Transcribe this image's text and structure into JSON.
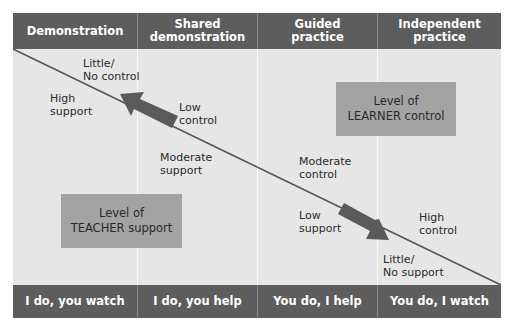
{
  "header": {
    "columns": [
      {
        "label": "Demonstration"
      },
      {
        "label": "Shared demonstration",
        "line1": "Shared",
        "line2": "demonstration"
      },
      {
        "label": "Guided practice",
        "line1": "Guided",
        "line2": "practice"
      },
      {
        "label": "Independent practice",
        "line1": "Independent",
        "line2": "practice"
      }
    ]
  },
  "footer": {
    "columns": [
      {
        "label": "I do, you watch"
      },
      {
        "label": "I do, you help"
      },
      {
        "label": "You do, I help"
      },
      {
        "label": "You do, I watch"
      }
    ]
  },
  "labels": {
    "little_no_control": {
      "line1": "Little/",
      "line2": "No control"
    },
    "high_support": {
      "line1": "High",
      "line2": "support"
    },
    "low_control": {
      "line1": "Low",
      "line2": "control"
    },
    "moderate_support": {
      "line1": "Moderate",
      "line2": "support"
    },
    "moderate_control": {
      "line1": "Moderate",
      "line2": "control"
    },
    "low_support": {
      "line1": "Low",
      "line2": "support"
    },
    "high_control": {
      "line1": "High",
      "line2": "control"
    },
    "little_no_support": {
      "line1": "Little/",
      "line2": "No support"
    }
  },
  "boxes": {
    "teacher": {
      "line1": "Level of",
      "line2": "TEACHER support"
    },
    "learner": {
      "line1": "Level of",
      "line2": "LEARNER control"
    }
  },
  "arrows": {
    "teacher_direction": "arrow-up-left",
    "learner_direction": "arrow-down-right"
  },
  "colors": {
    "bar": "#5d5d5d",
    "panel": "#e6e6e6",
    "box": "#a3a3a3",
    "arrow": "#5a5a5a",
    "line": "#555555"
  }
}
